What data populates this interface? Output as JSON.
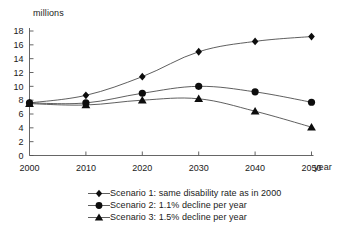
{
  "chart_data": {
    "type": "line",
    "title": "",
    "xlabel": "year",
    "ylabel": "millions",
    "x": [
      2000,
      2010,
      2020,
      2030,
      2040,
      2050
    ],
    "xticklabels": [
      "2000",
      "2010",
      "2020",
      "2030",
      "2040",
      "2050"
    ],
    "yticklabels": [
      "0",
      "2",
      "4",
      "6",
      "8",
      "10",
      "12",
      "14",
      "16",
      "18"
    ],
    "yticks": [
      0,
      2,
      4,
      6,
      8,
      10,
      12,
      14,
      16,
      18
    ],
    "ylim": [
      0,
      18
    ],
    "xlim": [
      2000,
      2050
    ],
    "grid": false,
    "legend_position": "bottom",
    "series": [
      {
        "name": "Scenario 1: same disability rate as in 2000",
        "marker": "diamond",
        "values": [
          7.6,
          8.7,
          11.4,
          15.0,
          16.5,
          17.2
        ]
      },
      {
        "name": "Scenario 2: 1.1% decline per year",
        "marker": "circle",
        "values": [
          7.6,
          7.6,
          9.0,
          10.0,
          9.2,
          7.7
        ]
      },
      {
        "name": "Scenario 3: 1.5% decline per year",
        "marker": "triangle",
        "values": [
          7.5,
          7.3,
          8.0,
          8.2,
          6.4,
          4.1
        ]
      }
    ]
  },
  "axes": {
    "y_unit_label": "millions",
    "x_unit_label": "year"
  },
  "legend": {
    "entries": [
      {
        "marker": "diamond",
        "label": "Scenario 1: same disability rate as in 2000"
      },
      {
        "marker": "circle",
        "label": "Scenario 2: 1.1% decline per year"
      },
      {
        "marker": "triangle",
        "label": "Scenario 3: 1.5% decline per year"
      }
    ]
  },
  "colors": {
    "marker": "#0d0d0d",
    "line": "#4d4d4d",
    "axis": "#555555",
    "text": "#1a1a1a",
    "background": "#ffffff"
  }
}
